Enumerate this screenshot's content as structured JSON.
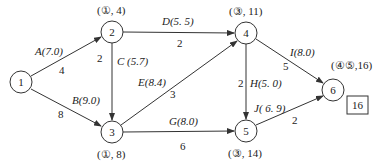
{
  "diagram": {
    "type": "network-diagram",
    "nodes": [
      {
        "id": "1",
        "label": "1",
        "x": 21,
        "y": 82,
        "annotation": ""
      },
      {
        "id": "2",
        "label": "2",
        "x": 112,
        "y": 32,
        "annotation": "(①, 4)"
      },
      {
        "id": "3",
        "label": "3",
        "x": 112,
        "y": 132,
        "annotation": "(①, 8)"
      },
      {
        "id": "4",
        "label": "4",
        "x": 246,
        "y": 33,
        "annotation": "(③, 11)"
      },
      {
        "id": "5",
        "label": "5",
        "x": 246,
        "y": 131,
        "annotation": "(③, 14)"
      },
      {
        "id": "6",
        "label": "6",
        "x": 333,
        "y": 90,
        "annotation": "(④⑤,16)"
      }
    ],
    "edges": [
      {
        "from": "1",
        "to": "2",
        "activity": "A(7.0)",
        "weight": "4"
      },
      {
        "from": "1",
        "to": "3",
        "activity": "B(9.0)",
        "weight": "8"
      },
      {
        "from": "2",
        "to": "3",
        "activity": "C (5.7)",
        "weight": "2"
      },
      {
        "from": "2",
        "to": "4",
        "activity": "D(5. 5)",
        "weight": "2"
      },
      {
        "from": "3",
        "to": "4",
        "activity": "E(8.4)",
        "weight": "3"
      },
      {
        "from": "3",
        "to": "5",
        "activity": "G(8.0)",
        "weight": "6"
      },
      {
        "from": "4",
        "to": "5",
        "activity": "H(5. 0)",
        "weight": "2"
      },
      {
        "from": "4",
        "to": "6",
        "activity": "I(8.0)",
        "weight": "5"
      },
      {
        "from": "5",
        "to": "6",
        "activity": "J( 6. 9)",
        "weight": "2"
      }
    ],
    "result_box": "16"
  }
}
